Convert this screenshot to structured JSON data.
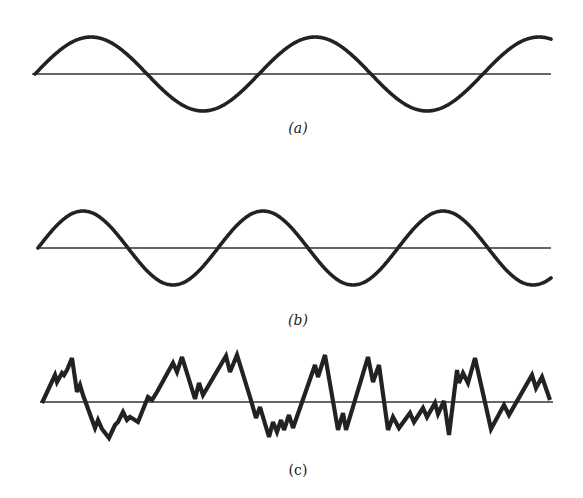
{
  "figure": {
    "panels": [
      {
        "id": "a",
        "label": "(a)",
        "description": "Pure sine wave, lower frequency",
        "baseline": {
          "x1": 32,
          "x2": 551,
          "y": 74
        },
        "wave": {
          "type": "sine",
          "x_start": 35,
          "x_end": 551,
          "amplitude": 37,
          "period": 224,
          "baseline_y": 74
        },
        "label_pos": {
          "x": 298,
          "y": 120
        }
      },
      {
        "id": "b",
        "label": "(b)",
        "description": "Pure sine wave, higher frequency",
        "baseline": {
          "x1": 38,
          "x2": 551,
          "y": 248
        },
        "wave": {
          "type": "sine",
          "x_start": 38,
          "x_end": 551,
          "amplitude": 37,
          "period": 180,
          "baseline_y": 248
        },
        "label_pos": {
          "x": 298,
          "y": 312
        }
      },
      {
        "id": "c",
        "label": "(c)",
        "description": "Irregular noisy waveform",
        "baseline": {
          "x1": 40,
          "x2": 553,
          "y": 402
        },
        "wave": {
          "type": "polyline",
          "points": [
            [
              42,
              403
            ],
            [
              55,
              375
            ],
            [
              57,
              382
            ],
            [
              62,
              373
            ],
            [
              64,
              375
            ],
            [
              67,
              370
            ],
            [
              72,
              358
            ],
            [
              77,
              392
            ],
            [
              80,
              385
            ],
            [
              83,
              395
            ],
            [
              95,
              428
            ],
            [
              98,
              420
            ],
            [
              102,
              429
            ],
            [
              109,
              438
            ],
            [
              115,
              425
            ],
            [
              118,
              422
            ],
            [
              123,
              412
            ],
            [
              127,
              420
            ],
            [
              130,
              417
            ],
            [
              138,
              422
            ],
            [
              148,
              397
            ],
            [
              152,
              400
            ],
            [
              157,
              392
            ],
            [
              173,
              363
            ],
            [
              177,
              372
            ],
            [
              182,
              357
            ],
            [
              195,
              399
            ],
            [
              199,
              383
            ],
            [
              203,
              395
            ],
            [
              226,
              356
            ],
            [
              230,
              372
            ],
            [
              237,
              355
            ],
            [
              250,
              397
            ],
            [
              256,
              418
            ],
            [
              260,
              407
            ],
            [
              269,
              437
            ],
            [
              273,
              422
            ],
            [
              277,
              432
            ],
            [
              281,
              420
            ],
            [
              284,
              430
            ],
            [
              289,
              415
            ],
            [
              293,
              428
            ],
            [
              315,
              365
            ],
            [
              318,
              377
            ],
            [
              325,
              355
            ],
            [
              338,
              430
            ],
            [
              343,
              413
            ],
            [
              346,
              430
            ],
            [
              368,
              357
            ],
            [
              373,
              382
            ],
            [
              379,
              365
            ],
            [
              388,
              430
            ],
            [
              393,
              417
            ],
            [
              399,
              428
            ],
            [
              410,
              413
            ],
            [
              414,
              422
            ],
            [
              423,
              408
            ],
            [
              427,
              417
            ],
            [
              435,
              403
            ],
            [
              438,
              414
            ],
            [
              444,
              401
            ],
            [
              449,
              435
            ],
            [
              457,
              370
            ],
            [
              459,
              383
            ],
            [
              463,
              373
            ],
            [
              468,
              383
            ],
            [
              475,
              358
            ],
            [
              491,
              429
            ],
            [
              504,
              405
            ],
            [
              509,
              415
            ],
            [
              532,
              375
            ],
            [
              536,
              388
            ],
            [
              542,
              377
            ],
            [
              550,
              400
            ]
          ]
        },
        "label_pos": {
          "x": 298,
          "y": 462
        }
      }
    ],
    "colors": {
      "stroke": "#222222",
      "background": "#ffffff"
    }
  }
}
